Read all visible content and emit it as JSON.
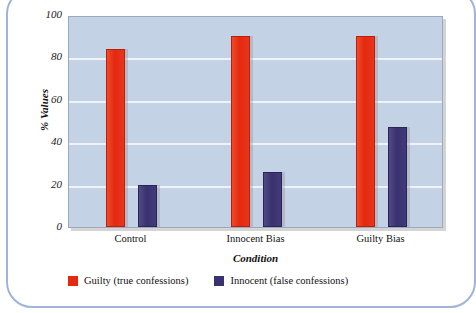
{
  "chart_data": {
    "type": "bar",
    "title": "",
    "xlabel": "Condition",
    "ylabel": "% Values",
    "categories": [
      "Control",
      "Innocent Bias",
      "Guilty Bias"
    ],
    "series": [
      {
        "name": "Guilty (true confessions)",
        "color": "#e4290f",
        "values": [
          84,
          90,
          90
        ]
      },
      {
        "name": "Innocent (false confessions)",
        "color": "#3a3270",
        "values": [
          20,
          26,
          47
        ]
      }
    ],
    "ylim": [
      0,
      100
    ],
    "yticks": [
      0,
      20,
      40,
      60,
      80,
      100
    ],
    "ytick_labels": [
      "0",
      "20",
      "40",
      "60",
      "80",
      "100"
    ],
    "grid": true,
    "legend_position": "bottom-left",
    "plot_background": "#c4d2e6",
    "frame_color": "#9fb4d8"
  }
}
